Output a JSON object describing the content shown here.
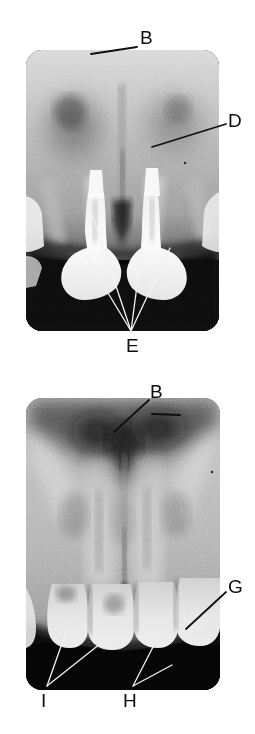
{
  "figure": {
    "kind": "dental-radiograph-figure",
    "background_color": "#ffffff",
    "label_color": "#0d0d0d",
    "leader_line_color_dark": "#101010",
    "leader_line_color_light": "#f2f2f2",
    "panels": [
      {
        "id": "radiograph-top",
        "name": "top-radiograph",
        "x": 26,
        "y": 50,
        "width": 193,
        "height": 281,
        "corner_radius": 16,
        "labels": [
          {
            "id": "label-b-top",
            "text": "B",
            "x": 140,
            "y": 28,
            "leaders": [
              {
                "x1": 137,
                "y1": 47,
                "x2": 91,
                "y2": 54,
                "stroke": "dark"
              }
            ]
          },
          {
            "id": "label-d-top",
            "text": "D",
            "x": 228,
            "y": 111,
            "leaders": [
              {
                "x1": 226,
                "y1": 124,
                "x2": 152,
                "y2": 147,
                "stroke": "dark"
              }
            ]
          },
          {
            "id": "label-e-top",
            "text": "E",
            "x": 126,
            "y": 336,
            "leaders": [
              {
                "x1": 131,
                "y1": 331,
                "x2": 89,
                "y2": 205,
                "stroke": "light"
              },
              {
                "x1": 131,
                "y1": 331,
                "x2": 85,
                "y2": 255,
                "stroke": "light"
              },
              {
                "x1": 131,
                "y1": 331,
                "x2": 147,
                "y2": 210,
                "stroke": "light"
              },
              {
                "x1": 131,
                "y1": 331,
                "x2": 170,
                "y2": 248,
                "stroke": "light"
              }
            ]
          }
        ]
      },
      {
        "id": "radiograph-bottom",
        "name": "bottom-radiograph",
        "x": 26,
        "y": 398,
        "width": 194,
        "height": 292,
        "corner_radius": 16,
        "labels": [
          {
            "id": "label-b-bottom",
            "text": "B",
            "x": 150,
            "y": 382,
            "leaders": [
              {
                "x1": 149,
                "y1": 400,
                "x2": 114,
                "y2": 432,
                "stroke": "dark"
              },
              {
                "x1": 152,
                "y1": 414,
                "x2": 180,
                "y2": 415,
                "stroke": "dark"
              }
            ]
          },
          {
            "id": "label-g-bottom",
            "text": "G",
            "x": 228,
            "y": 577,
            "leaders": [
              {
                "x1": 226,
                "y1": 592,
                "x2": 186,
                "y2": 629,
                "stroke": "dark"
              }
            ]
          },
          {
            "id": "label-h-bottom",
            "text": "H",
            "x": 123,
            "y": 691,
            "leaders": [
              {
                "x1": 133,
                "y1": 686,
                "x2": 154,
                "y2": 645,
                "stroke": "light"
              },
              {
                "x1": 133,
                "y1": 686,
                "x2": 172,
                "y2": 665,
                "stroke": "light"
              }
            ]
          },
          {
            "id": "label-i-bottom",
            "text": "I",
            "x": 41,
            "y": 691,
            "leaders": [
              {
                "x1": 47,
                "y1": 686,
                "x2": 66,
                "y2": 632,
                "stroke": "light"
              },
              {
                "x1": 47,
                "y1": 686,
                "x2": 110,
                "y2": 636,
                "stroke": "light"
              }
            ]
          }
        ]
      }
    ],
    "all_label_texts": [
      "B",
      "D",
      "E",
      "B",
      "G",
      "H",
      "I"
    ]
  }
}
